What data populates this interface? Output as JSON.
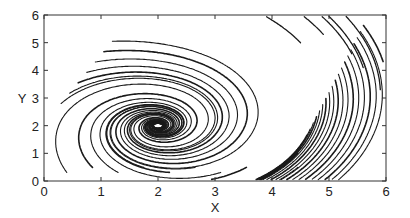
{
  "chart_data": {
    "type": "line",
    "subtype": "phase-portrait-streamlines",
    "title": "",
    "xlabel": "X",
    "ylabel": "Y",
    "xlim": [
      0,
      6
    ],
    "ylim": [
      0,
      6
    ],
    "xticks": [
      "0",
      "1",
      "2",
      "3",
      "4",
      "5",
      "6"
    ],
    "yticks": [
      "0",
      "1",
      "2",
      "3",
      "4",
      "5",
      "6"
    ],
    "grid": false,
    "legend": null,
    "annotations": [],
    "focus_point": {
      "x": 2.0,
      "y": 2.0
    }
  }
}
